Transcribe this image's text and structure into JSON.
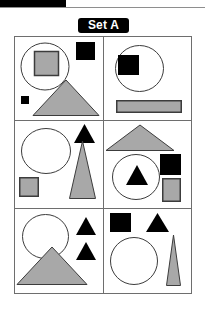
{
  "title": "Set A",
  "colors": {
    "gray_fill": "#a8a8a8",
    "black_fill": "#000000",
    "outline": "#3c3c3c",
    "frame": "#6e6e6e",
    "label_background": "#000000",
    "label_text": "#ffffff",
    "page_background": "#ffffff"
  },
  "header": {
    "black_bar": "decorative-black-bar",
    "rule": "horizontal-rule"
  },
  "grid": {
    "rows": 3,
    "columns": 2,
    "panel_count": 6
  },
  "panels": [
    {
      "id": "panel-1",
      "position": "top-left",
      "shapes": [
        {
          "name": "large-circle-outline",
          "type": "circle",
          "fill": "none",
          "stroke": "#3c3c3c"
        },
        {
          "name": "gray-square-in-circle",
          "type": "square",
          "fill": "#a8a8a8",
          "stroke": "#3c3c3c"
        },
        {
          "name": "black-square-top-right",
          "type": "square",
          "fill": "#000000",
          "stroke": "none"
        },
        {
          "name": "small-black-square-bottom-left",
          "type": "square",
          "fill": "#000000",
          "stroke": "none"
        },
        {
          "name": "large-gray-triangle",
          "type": "triangle",
          "fill": "#a8a8a8",
          "stroke": "#3c3c3c"
        }
      ]
    },
    {
      "id": "panel-2",
      "position": "top-right",
      "shapes": [
        {
          "name": "large-circle-outline",
          "type": "circle",
          "fill": "none",
          "stroke": "#3c3c3c"
        },
        {
          "name": "black-square-in-circle",
          "type": "square",
          "fill": "#000000",
          "stroke": "none"
        },
        {
          "name": "wide-gray-rectangle",
          "type": "rectangle",
          "fill": "#a8a8a8",
          "stroke": "#3c3c3c"
        }
      ]
    },
    {
      "id": "panel-3",
      "position": "middle-left",
      "shapes": [
        {
          "name": "large-circle-outline",
          "type": "circle",
          "fill": "none",
          "stroke": "#3c3c3c"
        },
        {
          "name": "small-black-triangle",
          "type": "triangle",
          "fill": "#000000",
          "stroke": "none"
        },
        {
          "name": "tall-gray-triangle",
          "type": "triangle",
          "fill": "#a8a8a8",
          "stroke": "#3c3c3c"
        },
        {
          "name": "gray-square-bottom-left",
          "type": "square",
          "fill": "#a8a8a8",
          "stroke": "#3c3c3c"
        }
      ]
    },
    {
      "id": "panel-4",
      "position": "middle-right",
      "shapes": [
        {
          "name": "wide-gray-triangle",
          "type": "triangle",
          "fill": "#a8a8a8",
          "stroke": "#3c3c3c"
        },
        {
          "name": "large-circle-outline",
          "type": "circle",
          "fill": "none",
          "stroke": "#3c3c3c"
        },
        {
          "name": "black-triangle-in-circle",
          "type": "triangle",
          "fill": "#000000",
          "stroke": "none"
        },
        {
          "name": "black-square-right",
          "type": "square",
          "fill": "#000000",
          "stroke": "none"
        },
        {
          "name": "gray-rectangle-bottom-right",
          "type": "rectangle",
          "fill": "#a8a8a8",
          "stroke": "#3c3c3c"
        }
      ]
    },
    {
      "id": "panel-5",
      "position": "bottom-left",
      "shapes": [
        {
          "name": "large-circle-outline",
          "type": "circle",
          "fill": "none",
          "stroke": "#3c3c3c"
        },
        {
          "name": "black-triangle-upper-right",
          "type": "triangle",
          "fill": "#000000",
          "stroke": "none"
        },
        {
          "name": "black-triangle-lower-right",
          "type": "triangle",
          "fill": "#000000",
          "stroke": "none"
        },
        {
          "name": "large-gray-triangle",
          "type": "triangle",
          "fill": "#a8a8a8",
          "stroke": "#3c3c3c"
        }
      ]
    },
    {
      "id": "panel-6",
      "position": "bottom-right",
      "shapes": [
        {
          "name": "black-square-top-left",
          "type": "square",
          "fill": "#000000",
          "stroke": "none"
        },
        {
          "name": "black-triangle-top-right",
          "type": "triangle",
          "fill": "#000000",
          "stroke": "none"
        },
        {
          "name": "large-circle-outline",
          "type": "circle",
          "fill": "none",
          "stroke": "#3c3c3c"
        },
        {
          "name": "narrow-gray-triangle",
          "type": "triangle",
          "fill": "#a8a8a8",
          "stroke": "#3c3c3c"
        }
      ]
    }
  ]
}
